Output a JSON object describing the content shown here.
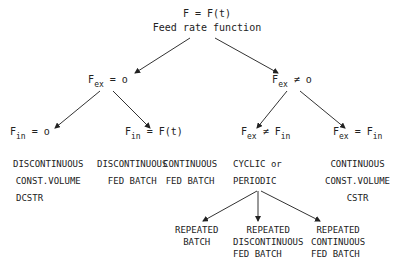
{
  "root": {
    "equation": "F = F(t)",
    "label": "Feed rate function"
  },
  "level1": [
    {
      "id": "fex-zero",
      "var": "F",
      "sub": "ex",
      "op": "=",
      "rhs": "o"
    },
    {
      "id": "fex-nonzero",
      "var": "F",
      "sub": "ex",
      "op": "≠",
      "rhs": "o"
    }
  ],
  "level2": [
    {
      "id": "fin-zero",
      "var": "F",
      "sub": "in",
      "op": "=",
      "rhs": "o",
      "rhs_sub": ""
    },
    {
      "id": "fin-ft",
      "var": "F",
      "sub": "in",
      "op": "=",
      "rhs": "F(t)",
      "rhs_sub": ""
    },
    {
      "id": "fex-ne-fin",
      "var": "F",
      "sub": "ex",
      "op": "≠",
      "rhs": "F",
      "rhs_sub": "in"
    },
    {
      "id": "fex-eq-fin",
      "var": "F",
      "sub": "ex",
      "op": "=",
      "rhs": "F",
      "rhs_sub": "in"
    }
  ],
  "categories": [
    {
      "lines": [
        "DISCONTINUOUS",
        "CONST.VOLUME",
        "DCSTR"
      ]
    },
    {
      "lines": [
        "DISCONTINUOUS",
        "FED BATCH"
      ]
    },
    {
      "lines": [
        "CONTINUOUS",
        "FED BATCH"
      ]
    },
    {
      "lines": [
        "CYCLIC or",
        "PERIODIC"
      ]
    },
    {
      "lines": [
        "CONTINUOUS",
        "CONST.VOLUME",
        "CSTR"
      ]
    }
  ],
  "cyclic_children": [
    {
      "lines": [
        "REPEATED",
        "BATCH"
      ]
    },
    {
      "lines": [
        "REPEATED",
        "DISCONTINUOUS",
        "FED BATCH"
      ]
    },
    {
      "lines": [
        "REPEATED",
        "CONTINUOUS",
        "FED BATCH"
      ]
    }
  ]
}
